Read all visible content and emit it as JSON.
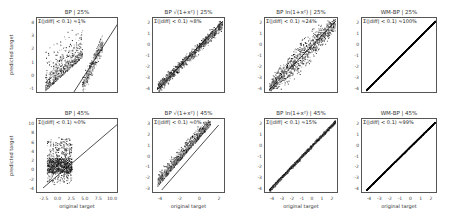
{
  "figure": {
    "ylabel": "predicted target",
    "xlabel": "original target"
  },
  "chart_data": [
    {
      "type": "scatter",
      "title": "BP | 25%",
      "annotation": "Σ(|diff| < 0.1) ≈1%",
      "xlabel": "",
      "ylabel": "predicted target",
      "ylim": [
        -1,
        4.5
      ],
      "yticks": [
        "4",
        "3",
        "2",
        "1",
        "0",
        "-1"
      ],
      "xticks": [],
      "description": "Wide spread cloud above identity line; many points deviate"
    },
    {
      "type": "scatter",
      "title": "BP √(1+x²) | 25%",
      "annotation": "Σ(|diff| < 0.1) ≈8%",
      "xlabel": "",
      "ylabel": "",
      "ylim": [
        -4,
        2.5
      ],
      "yticks": [
        "2",
        "1",
        "0",
        "-1",
        "-2",
        "-3",
        "-4"
      ],
      "xticks": [],
      "description": "Points roughly along identity with moderate scatter"
    },
    {
      "type": "scatter",
      "title": "BP ln(1+x²) | 25%",
      "annotation": "Σ(|diff| < 0.1) ≈24%",
      "xlabel": "",
      "ylabel": "",
      "ylim": [
        -4,
        2.3
      ],
      "yticks": [
        "2",
        "1",
        "0",
        "-1",
        "-2",
        "-3",
        "-4"
      ],
      "xticks": [],
      "description": "Points along identity with fan-shaped scatter"
    },
    {
      "type": "scatter",
      "title": "WM-BP | 25%",
      "annotation": "Σ(|diff| < 0.1) ≈100%",
      "xlabel": "",
      "ylabel": "",
      "ylim": [
        -4,
        2.3
      ],
      "yticks": [
        "2",
        "1",
        "0",
        "-1",
        "-2",
        "-3",
        "-4"
      ],
      "xticks": [],
      "description": "Points exactly on identity line"
    },
    {
      "type": "scatter",
      "title": "BP | 45%",
      "annotation": "Σ(|diff| < 0.1) ≈0%",
      "xlabel": "original target",
      "ylabel": "predicted target",
      "xlim": [
        -4,
        10.5
      ],
      "ylim": [
        -4,
        11
      ],
      "yticks": [
        "10",
        "8",
        "6",
        "4",
        "2",
        "0",
        "-2",
        "-4"
      ],
      "xticks": [
        "-2.5",
        "0.0",
        "2.5",
        "5.0",
        "7.5",
        "10.0"
      ],
      "description": "Large cloud far above identity line"
    },
    {
      "type": "scatter",
      "title": "BP √(1+x²) | 45%",
      "annotation": "Σ(|diff| < 0.1) ≈0%",
      "xlabel": "original target",
      "ylabel": "",
      "xlim": [
        -4.2,
        2.6
      ],
      "ylim": [
        -3.5,
        3.2
      ],
      "yticks": [
        "3",
        "2",
        "1",
        "0",
        "-1",
        "-2",
        "-3"
      ],
      "xticks": [
        "-4",
        "-2",
        "0",
        "2"
      ],
      "description": "Points in band offset above identity line"
    },
    {
      "type": "scatter",
      "title": "BP ln(1+x²) | 45%",
      "annotation": "Σ(|diff| < 0.1) ≈15%",
      "xlabel": "original target",
      "ylabel": "",
      "xlim": [
        -4.3,
        2.3
      ],
      "ylim": [
        -4.2,
        2.2
      ],
      "yticks": [
        "2",
        "1",
        "0",
        "-1",
        "-2",
        "-3",
        "-4"
      ],
      "xticks": [
        "-4",
        "-3",
        "-2",
        "-1",
        "0",
        "1",
        "2"
      ],
      "description": "Points close to identity, slight spread"
    },
    {
      "type": "scatter",
      "title": "WM-BP | 45%",
      "annotation": "Σ(|diff| < 0.1) ≈99%",
      "xlabel": "original target",
      "ylabel": "",
      "xlim": [
        -4.3,
        2.3
      ],
      "ylim": [
        -4.2,
        2.2
      ],
      "yticks": [
        "2",
        "1",
        "0",
        "-1",
        "-2",
        "-3",
        "-4"
      ],
      "xticks": [
        "-4",
        "-3",
        "-2",
        "-1",
        "0",
        "1",
        "2"
      ],
      "description": "Points exactly on identity line"
    }
  ]
}
